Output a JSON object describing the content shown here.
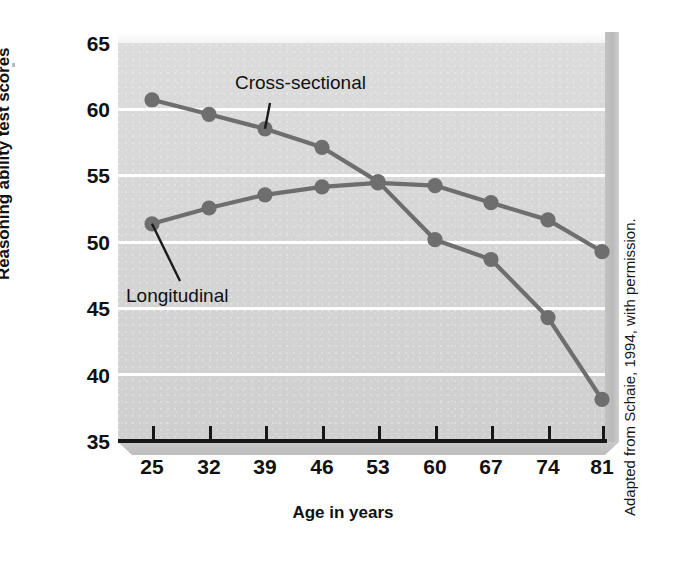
{
  "figure": {
    "credit": "Adapted from Schaie, 1994, with permission."
  },
  "chart_data": {
    "type": "line",
    "title": "",
    "xlabel": "Age in years",
    "ylabel": "Reasoning ability test scores",
    "x": [
      25,
      32,
      39,
      46,
      53,
      60,
      67,
      74,
      81
    ],
    "categories": [
      "25",
      "32",
      "39",
      "46",
      "53",
      "60",
      "67",
      "74",
      "81"
    ],
    "xtick_labels": [
      "25",
      "32",
      "39",
      "46",
      "53",
      "60",
      "67",
      "74",
      "81"
    ],
    "ytick_labels": [
      "65",
      "60",
      "55",
      "50",
      "45",
      "40",
      "35"
    ],
    "yticks": [
      65,
      60,
      55,
      50,
      45,
      40,
      35
    ],
    "ylim": [
      35,
      65
    ],
    "xlim": [
      25,
      81
    ],
    "grid": "horizontal-white",
    "legend": "inline-annotations",
    "series": [
      {
        "name": "Cross-sectional",
        "values": [
          60.7,
          59.6,
          58.5,
          57.1,
          54.5,
          50.1,
          48.6,
          44.2,
          38.0
        ],
        "color": "#6e6e6e",
        "marker": "circle"
      },
      {
        "name": "Longitudinal",
        "values": [
          51.3,
          52.5,
          53.5,
          54.1,
          54.4,
          54.2,
          52.9,
          51.6,
          49.2
        ],
        "color": "#6e6e6e",
        "marker": "circle"
      }
    ],
    "annotations": [
      {
        "text": "Cross-sectional",
        "points_to_series": "Cross-sectional",
        "points_to_index": 2
      },
      {
        "text": "Longitudinal",
        "points_to_series": "Longitudinal",
        "points_to_index": 0
      }
    ]
  },
  "colors": {
    "plot_background": "#d7d7d7",
    "gridline": "#ffffff",
    "line": "#6e6e6e",
    "axis": "#17171a",
    "text": "#111114"
  }
}
